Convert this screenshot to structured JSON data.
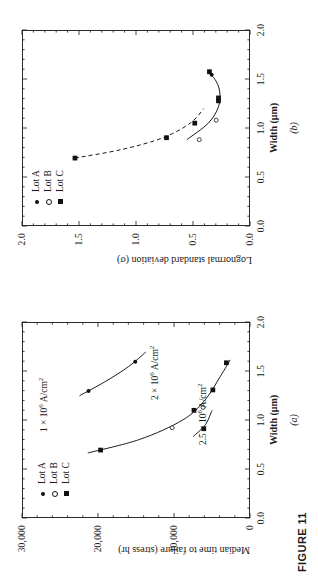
{
  "figure": {
    "caption": "FIGURE 11"
  },
  "legend": {
    "items": [
      {
        "label": "Lot A",
        "symbol": "filled-circle"
      },
      {
        "label": "Lot B",
        "symbol": "open-circle"
      },
      {
        "label": "Lot C",
        "symbol": "filled-square"
      }
    ]
  },
  "panel_a": {
    "label": "(a)",
    "annotations": [
      {
        "text": "1 × 10⁶ A/cm²"
      },
      {
        "text": "2 × 10⁶ A/cm²"
      },
      {
        "text": "2.5 × 10⁶ A/cm²"
      }
    ]
  },
  "panel_b": {
    "label": "(b)"
  },
  "chart_data": [
    {
      "id": "panel_a",
      "type": "scatter",
      "title": "",
      "panel_label": "(a)",
      "xlabel": "Width (μm)",
      "ylabel": "Median time to failure (stress hr)",
      "xlim": [
        0.0,
        2.0
      ],
      "ylim": [
        0,
        30000
      ],
      "xticks": [
        0.0,
        0.5,
        1.0,
        1.5,
        2.0
      ],
      "xticklabels": [
        "0.0",
        "0.5",
        "1.0",
        "1.5",
        "2.0"
      ],
      "yticks": [
        0,
        10000,
        20000,
        30000
      ],
      "yticklabels": [
        "0",
        "10,000",
        "20,000",
        "30,000"
      ],
      "grid": false,
      "legend_position": "upper-left",
      "annotations": [
        {
          "text": "1 × 10⁶ A/cm²",
          "x": 1.05,
          "y": 27000
        },
        {
          "text": "2 × 10⁶ A/cm²",
          "x": 1.43,
          "y": 11500
        },
        {
          "text": "2.5 × 10⁶ A/cm²",
          "x": 1.13,
          "y": 3900
        }
      ],
      "series": [
        {
          "name": "1 x 10^6 A/cm2 curve",
          "style": "solid-line",
          "points": [
            {
              "x": 1.3,
              "y": 21300,
              "lot": "Lot A",
              "symbol": "filled-circle"
            },
            {
              "x": 1.6,
              "y": 15100,
              "lot": "Lot A",
              "symbol": "filled-circle"
            }
          ],
          "curve": [
            {
              "x": 1.25,
              "y": 22500
            },
            {
              "x": 1.4,
              "y": 19000
            },
            {
              "x": 1.55,
              "y": 16000
            },
            {
              "x": 1.7,
              "y": 13700
            }
          ]
        },
        {
          "name": "2 x 10^6 A/cm2 curve",
          "style": "solid-line",
          "points": [
            {
              "x": 0.69,
              "y": 19700,
              "lot": "Lot C",
              "symbol": "filled-square"
            },
            {
              "x": 0.92,
              "y": 10200,
              "lot": "Lot B",
              "symbol": "open-circle"
            },
            {
              "x": 1.1,
              "y": 7300,
              "lot": "Lot C",
              "symbol": "filled-square"
            },
            {
              "x": 1.13,
              "y": 6100,
              "lot": "Lot B",
              "symbol": "open-circle"
            },
            {
              "x": 1.31,
              "y": 4800,
              "lot": "Lot C",
              "symbol": "filled-square"
            },
            {
              "x": 1.59,
              "y": 3000,
              "lot": "Lot C",
              "symbol": "filled-square"
            }
          ],
          "curve": [
            {
              "x": 0.66,
              "y": 21400
            },
            {
              "x": 0.8,
              "y": 14500
            },
            {
              "x": 1.0,
              "y": 8800
            },
            {
              "x": 1.2,
              "y": 5900
            },
            {
              "x": 1.45,
              "y": 3800
            },
            {
              "x": 1.62,
              "y": 2500
            }
          ]
        },
        {
          "name": "2.5 x 10^6 A/cm2 curve",
          "style": "solid-line",
          "points": [
            {
              "x": 0.91,
              "y": 6000,
              "lot": "Lot C",
              "symbol": "filled-square"
            }
          ],
          "curve": [
            {
              "x": 0.83,
              "y": 7400
            },
            {
              "x": 0.95,
              "y": 5800
            },
            {
              "x": 1.1,
              "y": 4900
            }
          ]
        }
      ]
    },
    {
      "id": "panel_b",
      "type": "scatter",
      "title": "",
      "panel_label": "(b)",
      "xlabel": "Width (μm)",
      "ylabel": "Lognormal standard deviation (σ)",
      "xlim": [
        0.0,
        2.0
      ],
      "ylim": [
        0.0,
        2.0
      ],
      "xticks": [
        0.0,
        0.5,
        1.0,
        1.5,
        2.0
      ],
      "xticklabels": [
        "0.0",
        "0.5",
        "1.0",
        "1.5",
        "2.0"
      ],
      "yticks": [
        0.0,
        0.5,
        1.0,
        1.5,
        2.0
      ],
      "yticklabels": [
        "0.0",
        "0.5",
        "1.0",
        "1.5",
        "2.0"
      ],
      "grid": false,
      "legend_position": "upper-left",
      "annotations": [],
      "series": [
        {
          "name": "upper branch (dashed)",
          "style": "dashed-line",
          "points": [
            {
              "x": 0.69,
              "y": 1.54,
              "lot": "Lot C",
              "symbol": "filled-square"
            },
            {
              "x": 0.9,
              "y": 0.73,
              "lot": "Lot C",
              "symbol": "filled-square"
            }
          ],
          "curve": [
            {
              "x": 0.69,
              "y": 1.54
            },
            {
              "x": 0.78,
              "y": 1.12
            },
            {
              "x": 0.9,
              "y": 0.76
            },
            {
              "x": 1.05,
              "y": 0.52
            },
            {
              "x": 1.2,
              "y": 0.4
            }
          ]
        },
        {
          "name": "lower branch (solid)",
          "style": "solid-line",
          "points": [
            {
              "x": 0.88,
              "y": 0.44,
              "lot": "Lot B",
              "symbol": "open-circle"
            },
            {
              "x": 1.05,
              "y": 0.48,
              "lot": "Lot C",
              "symbol": "filled-square"
            },
            {
              "x": 1.08,
              "y": 0.29,
              "lot": "Lot B",
              "symbol": "open-circle"
            },
            {
              "x": 1.28,
              "y": 0.27,
              "lot": "Lot C",
              "symbol": "filled-square"
            },
            {
              "x": 1.31,
              "y": 0.27,
              "lot": "Lot C",
              "symbol": "filled-square"
            },
            {
              "x": 1.55,
              "y": 0.33,
              "lot": "Lot A",
              "symbol": "filled-circle"
            },
            {
              "x": 1.58,
              "y": 0.35,
              "lot": "Lot C",
              "symbol": "filled-square"
            }
          ],
          "curve": [
            {
              "x": 0.88,
              "y": 0.55
            },
            {
              "x": 1.05,
              "y": 0.36
            },
            {
              "x": 1.22,
              "y": 0.27
            },
            {
              "x": 1.38,
              "y": 0.26
            },
            {
              "x": 1.5,
              "y": 0.3
            },
            {
              "x": 1.57,
              "y": 0.36
            }
          ]
        }
      ]
    }
  ]
}
